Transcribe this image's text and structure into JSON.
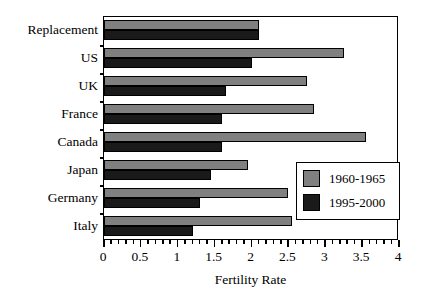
{
  "chart_data": {
    "type": "bar",
    "orientation": "horizontal",
    "title": "",
    "xlabel": "Fertility Rate",
    "ylabel": "",
    "xlim": [
      0,
      4
    ],
    "xticks": [
      "0",
      "0.5",
      "1",
      "1.5",
      "2",
      "2.5",
      "3",
      "3.5",
      "4"
    ],
    "xtick_values": [
      0,
      0.5,
      1,
      1.5,
      2,
      2.5,
      3,
      3.5,
      4
    ],
    "minor_tick_step": 0.1,
    "grid": false,
    "legend_position": "lower right (inside axes)",
    "categories": [
      "Replacement",
      "US",
      "UK",
      "France",
      "Canada",
      "Japan",
      "Germany",
      "Italy"
    ],
    "series": [
      {
        "name": "1960-1965",
        "color": "#808080",
        "values": [
          2.1,
          3.25,
          2.75,
          2.85,
          3.55,
          1.95,
          2.5,
          2.55
        ]
      },
      {
        "name": "1995-2000",
        "color": "#1a1a1a",
        "values": [
          2.1,
          2.0,
          1.65,
          1.6,
          1.6,
          1.45,
          1.3,
          1.2
        ]
      }
    ]
  },
  "legend": {
    "entries": [
      {
        "label": "1960-1965",
        "swatch": "gray"
      },
      {
        "label": "1995-2000",
        "swatch": "black"
      }
    ]
  },
  "axis": {
    "x_title": "Fertility Rate"
  },
  "colors": {
    "series_1960": "#808080",
    "series_1995": "#1a1a1a",
    "frame": "#000000",
    "background": "#ffffff"
  }
}
